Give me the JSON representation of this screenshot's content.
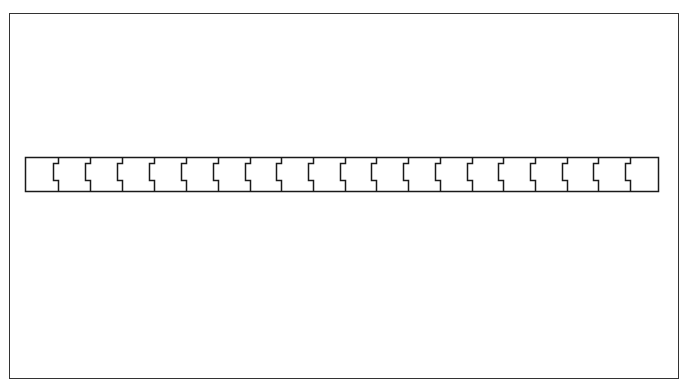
{
  "caption": {
    "text": "",
    "clipped": true
  },
  "frame": {
    "x": 9,
    "y": 13,
    "width": 669,
    "height": 365,
    "stroke": "#333333"
  },
  "strip": {
    "x": 25,
    "y": 157,
    "width": 633,
    "height": 34,
    "stroke": "#1a1a1a",
    "fill": "#ffffff",
    "segment_count": 20,
    "divider_positions": [
      58,
      90,
      122,
      154,
      186,
      218,
      250,
      281,
      313,
      345,
      376,
      408,
      440,
      472,
      503,
      535,
      567,
      598,
      630
    ],
    "notch": {
      "depth": 5,
      "top_offset": 6,
      "bottom_offset": 11
    }
  }
}
